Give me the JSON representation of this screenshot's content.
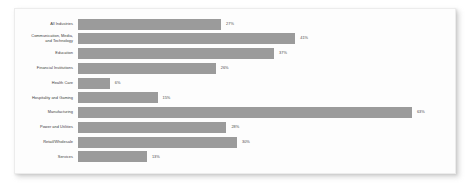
{
  "card": {
    "accent_color": "#9b9b9b",
    "card_background": "#fdfdfd",
    "page_background": "#ffffff"
  },
  "chart_data": {
    "type": "bar",
    "orientation": "horizontal",
    "title": "",
    "subtitle": "",
    "xlabel": "",
    "ylabel": "",
    "xlim": [
      0,
      70
    ],
    "grid": false,
    "legend": null,
    "value_suffix": "%",
    "categories": [
      "All Industries",
      "Communication, Media,\nand Technology",
      "Education",
      "Financial Institutions",
      "Health Care",
      "Hospitality and Gaming",
      "Manufacturing",
      "Power and Utilities",
      "Retail/Wholesale",
      "Services"
    ],
    "values": [
      27,
      41,
      37,
      26,
      6,
      15,
      63,
      28,
      30,
      13
    ],
    "labels": [
      "27%",
      "41%",
      "37%",
      "26%",
      "6%",
      "15%",
      "63%",
      "28%",
      "30%",
      "13%"
    ],
    "bars": [
      {
        "category": "All Industries",
        "value": 27,
        "label": "27%"
      },
      {
        "category": "Communication, Media,\nand Technology",
        "value": 41,
        "label": "41%"
      },
      {
        "category": "Education",
        "value": 37,
        "label": "37%"
      },
      {
        "category": "Financial Institutions",
        "value": 26,
        "label": "26%"
      },
      {
        "category": "Health Care",
        "value": 6,
        "label": "6%"
      },
      {
        "category": "Hospitality and Gaming",
        "value": 15,
        "label": "15%"
      },
      {
        "category": "Manufacturing",
        "value": 63,
        "label": "63%"
      },
      {
        "category": "Power and Utilities",
        "value": 28,
        "label": "28%"
      },
      {
        "category": "Retail/Wholesale",
        "value": 30,
        "label": "30%"
      },
      {
        "category": "Services",
        "value": 13,
        "label": "13%"
      }
    ]
  }
}
